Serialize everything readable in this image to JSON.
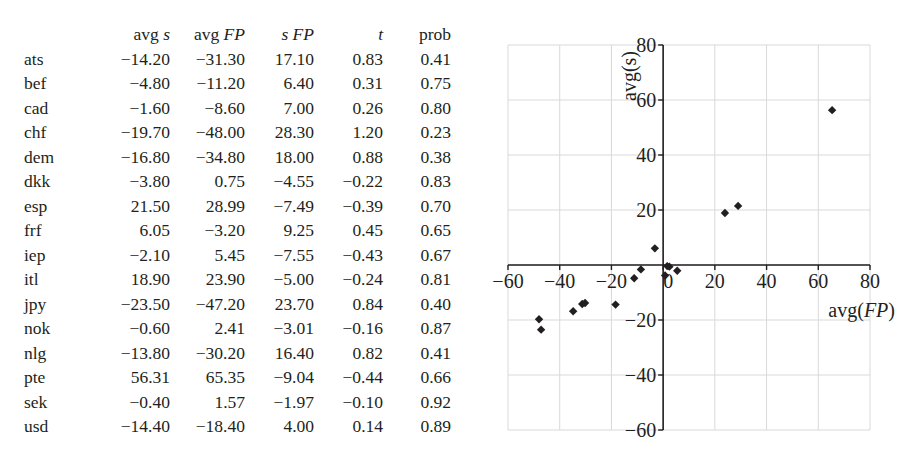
{
  "table": {
    "columns": [
      {
        "label": "",
        "italic_part": ""
      },
      {
        "label": "avg ",
        "italic_part": "s"
      },
      {
        "label": "avg ",
        "italic_part": "FP"
      },
      {
        "label": "",
        "italic_part": "s FP"
      },
      {
        "label": "",
        "italic_part": "t"
      },
      {
        "label": "prob",
        "italic_part": ""
      }
    ],
    "rows": [
      {
        "name": "ats",
        "avg_s": "−14.20",
        "avg_fp": "−31.30",
        "s_fp": "17.10",
        "t": "0.83",
        "prob": "0.41"
      },
      {
        "name": "bef",
        "avg_s": "−4.80",
        "avg_fp": "−11.20",
        "s_fp": "6.40",
        "t": "0.31",
        "prob": "0.75"
      },
      {
        "name": "cad",
        "avg_s": "−1.60",
        "avg_fp": "−8.60",
        "s_fp": "7.00",
        "t": "0.26",
        "prob": "0.80"
      },
      {
        "name": "chf",
        "avg_s": "−19.70",
        "avg_fp": "−48.00",
        "s_fp": "28.30",
        "t": "1.20",
        "prob": "0.23"
      },
      {
        "name": "dem",
        "avg_s": "−16.80",
        "avg_fp": "−34.80",
        "s_fp": "18.00",
        "t": "0.88",
        "prob": "0.38"
      },
      {
        "name": "dkk",
        "avg_s": "−3.80",
        "avg_fp": "0.75",
        "s_fp": "−4.55",
        "t": "−0.22",
        "prob": "0.83"
      },
      {
        "name": "esp",
        "avg_s": "21.50",
        "avg_fp": "28.99",
        "s_fp": "−7.49",
        "t": "−0.39",
        "prob": "0.70"
      },
      {
        "name": "frf",
        "avg_s": "6.05",
        "avg_fp": "−3.20",
        "s_fp": "9.25",
        "t": "0.45",
        "prob": "0.65"
      },
      {
        "name": "iep",
        "avg_s": "−2.10",
        "avg_fp": "5.45",
        "s_fp": "−7.55",
        "t": "−0.43",
        "prob": "0.67"
      },
      {
        "name": "itl",
        "avg_s": "18.90",
        "avg_fp": "23.90",
        "s_fp": "−5.00",
        "t": "−0.24",
        "prob": "0.81"
      },
      {
        "name": "jpy",
        "avg_s": "−23.50",
        "avg_fp": "−47.20",
        "s_fp": "23.70",
        "t": "0.84",
        "prob": "0.40"
      },
      {
        "name": "nok",
        "avg_s": "−0.60",
        "avg_fp": "2.41",
        "s_fp": "−3.01",
        "t": "−0.16",
        "prob": "0.87"
      },
      {
        "name": "nlg",
        "avg_s": "−13.80",
        "avg_fp": "−30.20",
        "s_fp": "16.40",
        "t": "0.82",
        "prob": "0.41"
      },
      {
        "name": "pte",
        "avg_s": "56.31",
        "avg_fp": "65.35",
        "s_fp": "−9.04",
        "t": "−0.44",
        "prob": "0.66"
      },
      {
        "name": "sek",
        "avg_s": "−0.40",
        "avg_fp": "1.57",
        "s_fp": "−1.97",
        "t": "−0.10",
        "prob": "0.92"
      },
      {
        "name": "usd",
        "avg_s": "−14.40",
        "avg_fp": "−18.40",
        "s_fp": "4.00",
        "t": "0.14",
        "prob": "0.89"
      }
    ]
  },
  "chart_data": [
    {
      "type": "table",
      "title": "",
      "columns": [
        "",
        "avg s",
        "avg FP",
        "s FP",
        "t",
        "prob"
      ],
      "rows": [
        [
          "ats",
          -14.2,
          -31.3,
          17.1,
          0.83,
          0.41
        ],
        [
          "bef",
          -4.8,
          -11.2,
          6.4,
          0.31,
          0.75
        ],
        [
          "cad",
          -1.6,
          -8.6,
          7.0,
          0.26,
          0.8
        ],
        [
          "chf",
          -19.7,
          -48.0,
          28.3,
          1.2,
          0.23
        ],
        [
          "dem",
          -16.8,
          -34.8,
          18.0,
          0.88,
          0.38
        ],
        [
          "dkk",
          -3.8,
          0.75,
          -4.55,
          -0.22,
          0.83
        ],
        [
          "esp",
          21.5,
          28.99,
          -7.49,
          -0.39,
          0.7
        ],
        [
          "frf",
          6.05,
          -3.2,
          9.25,
          0.45,
          0.65
        ],
        [
          "iep",
          -2.1,
          5.45,
          -7.55,
          -0.43,
          0.67
        ],
        [
          "itl",
          18.9,
          23.9,
          -5.0,
          -0.24,
          0.81
        ],
        [
          "jpy",
          -23.5,
          -47.2,
          23.7,
          0.84,
          0.4
        ],
        [
          "nok",
          -0.6,
          2.41,
          -3.01,
          -0.16,
          0.87
        ],
        [
          "nlg",
          -13.8,
          -30.2,
          16.4,
          0.82,
          0.41
        ],
        [
          "pte",
          56.31,
          65.35,
          -9.04,
          -0.44,
          0.66
        ],
        [
          "sek",
          -0.4,
          1.57,
          -1.97,
          -0.1,
          0.92
        ],
        [
          "usd",
          -14.4,
          -18.4,
          4.0,
          0.14,
          0.89
        ]
      ]
    },
    {
      "type": "scatter",
      "title": "",
      "xlabel": "avg(FP)",
      "ylabel": "avg(s)",
      "xlim": [
        -60,
        80
      ],
      "ylim": [
        -60,
        80
      ],
      "xticks": [
        -60,
        -40,
        -20,
        0,
        20,
        40,
        60,
        80
      ],
      "yticks": [
        -60,
        -40,
        -20,
        20,
        40,
        60,
        80
      ],
      "grid": true,
      "legend": "none",
      "marker": "diamond",
      "x": [
        -31.3,
        -11.2,
        -8.6,
        -48.0,
        -34.8,
        0.75,
        28.99,
        -3.2,
        5.45,
        23.9,
        -47.2,
        2.41,
        -30.2,
        65.35,
        1.57,
        -18.4
      ],
      "y": [
        -14.2,
        -4.8,
        -1.6,
        -19.7,
        -16.8,
        -3.8,
        21.5,
        6.05,
        -2.1,
        18.9,
        -23.5,
        -0.6,
        -13.8,
        56.31,
        -0.4,
        -14.4
      ]
    }
  ],
  "chart": {
    "x_axis_label_prefix": "avg(",
    "x_axis_label_italic": "FP",
    "x_axis_label_suffix": ")",
    "y_axis_label": "avg(s)",
    "x_tick_labels": [
      "−60",
      "−40",
      "−20",
      "0",
      "20",
      "40",
      "60",
      "80"
    ],
    "y_tick_labels": [
      "80",
      "60",
      "40",
      "20",
      "−20",
      "−40",
      "−60"
    ],
    "colors": {
      "grid": "#d9d9d9",
      "axis": "#231f20",
      "marker": "#231f20"
    }
  }
}
